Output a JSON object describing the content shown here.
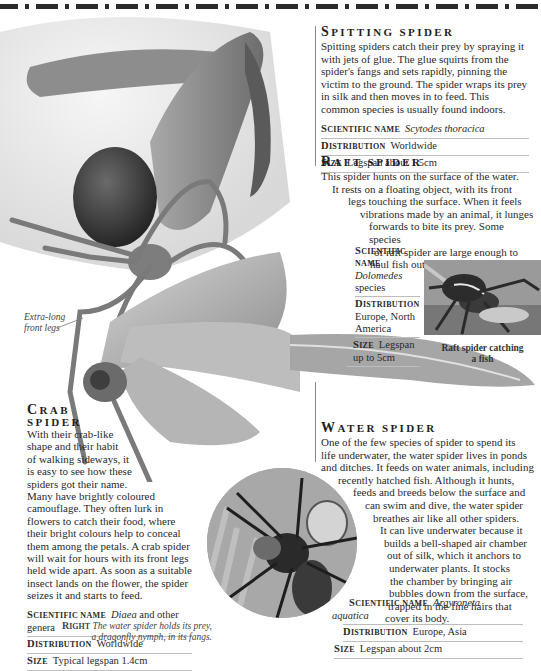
{
  "spitting": {
    "title_cap": "S",
    "title_rest": "pitting spider",
    "body": "Spitting spiders catch their prey by spraying it with jets of glue. The glue squirts from the spider's fangs and sets rapidly, pinning the victim to the ground. The spider wraps its prey in silk and then moves in to feed. This common species is usually found indoors.",
    "facts": [
      {
        "key_cap": "S",
        "key_rest": "cientific name",
        "value": "Scytodes thoracica",
        "italic": true
      },
      {
        "key_cap": "D",
        "key_rest": "istribution",
        "value": "Worldwide",
        "italic": false
      },
      {
        "key_cap": "S",
        "key_rest": "ize",
        "value": "Legspan about 1.5cm",
        "italic": false
      }
    ]
  },
  "raft": {
    "title_cap": "R",
    "title_rest": "aft spider",
    "body_lines": [
      "This spider hunts on the surface of the water.",
      "It rests on a floating object, with its front",
      "legs touching the surface. When it feels",
      "vibrations made by an animal, it lunges",
      "forwards to bite its prey. Some species",
      "of raft spider are large enough to",
      "haul fish out of the water."
    ],
    "facts": [
      {
        "key_cap": "S",
        "key_rest": "cientific name",
        "value": "Dolomedes",
        "value2": "species"
      },
      {
        "key_cap": "D",
        "key_rest": "istribution",
        "value": "Europe, North America"
      },
      {
        "key_cap": "S",
        "key_rest": "ize",
        "value": "Legspan up to 5cm"
      }
    ],
    "photo_caption_1": "Raft spider catching",
    "photo_caption_2": "a fish"
  },
  "crab": {
    "title_cap": "C",
    "title_line1_rest": "rab",
    "title_line2": "spider",
    "body_lines": [
      "With their crab-like",
      "shape and their habit",
      "of walking sideways, it",
      "is easy to see how these",
      "spiders got their name.",
      "Many have brightly coloured",
      "camouflage. They often lurk in",
      "flowers to catch their food, where",
      "their bright colours help to conceal",
      "them among the petals. A crab spider",
      "will wait for hours with its front legs",
      "held wide apart. As soon as a suitable",
      "insect lands on the flower, the spider",
      "seizes it and starts to feed."
    ],
    "facts": [
      {
        "key_cap": "S",
        "key_rest": "cientific name",
        "value_italic": "Diaea",
        "value": " and other genera"
      },
      {
        "key_cap": "D",
        "key_rest": "istribution",
        "value": "Worldwide"
      },
      {
        "key_cap": "S",
        "key_rest": "ize",
        "value": "Typical legspan 1.4cm"
      }
    ],
    "annotation_1": "Extra-long",
    "annotation_2": "front legs"
  },
  "water": {
    "title_cap": "W",
    "title_rest": "ater spider",
    "body_lines": [
      "One of the few species of spider to spend its",
      "life underwater, the water spider lives in ponds",
      "and ditches. It feeds on water animals, including",
      "recently hatched fish. Although it hunts,",
      "feeds and breeds below the surface and",
      "can swim and dive, the water spider",
      "breathes air like all other spiders.",
      "It can live underwater because it",
      "builds a bell-shaped air chamber",
      "out of silk, which it anchors to",
      "underwater plants. It stocks",
      "the chamber by bringing air",
      "bubbles down from the surface,",
      "trapped in the fine hairs that",
      "cover its body."
    ],
    "facts": [
      {
        "key_cap": "S",
        "key_rest": "cientific name",
        "value": "Argyroneta",
        "value2": "aquatica"
      },
      {
        "key_cap": "D",
        "key_rest": "istribution",
        "value": "Europe, Asia"
      },
      {
        "key_cap": "S",
        "key_rest": "ize",
        "value": "Legspan about 2cm"
      }
    ],
    "caption_label_cap": "R",
    "caption_label_rest": "ight",
    "caption_1": "The water spider holds its prey,",
    "caption_2": "a dragonfly nymph, in its fangs."
  }
}
